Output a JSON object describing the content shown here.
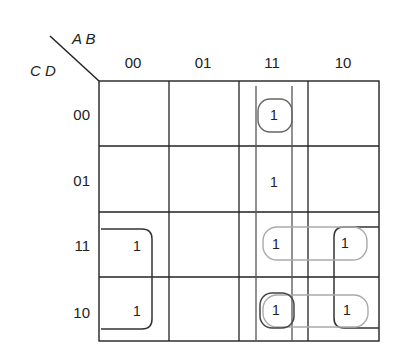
{
  "kmap": {
    "row_variables": "C D",
    "col_variables": "A B",
    "col_headers": [
      "00",
      "01",
      "11",
      "10"
    ],
    "row_headers": [
      "00",
      "01",
      "11",
      "10"
    ],
    "cells": [
      [
        "",
        "",
        "1",
        ""
      ],
      [
        "",
        "",
        "1",
        ""
      ],
      [
        "1",
        "",
        "1",
        "1"
      ],
      [
        "1",
        "",
        "1",
        "1"
      ]
    ],
    "groups": [
      {
        "name": "column-11-all-rows",
        "cells": [
          [
            0,
            2
          ],
          [
            1,
            2
          ],
          [
            2,
            2
          ],
          [
            3,
            2
          ]
        ],
        "color": "#555555"
      },
      {
        "name": "single-cell-00-11",
        "cells": [
          [
            0,
            2
          ]
        ],
        "color": "#777777"
      },
      {
        "name": "rows-11-10-col-00-wrap",
        "cells": [
          [
            2,
            0
          ],
          [
            3,
            0
          ]
        ],
        "color": "#333333"
      },
      {
        "name": "rows-11-10-col-10-wrap",
        "cells": [
          [
            2,
            3
          ],
          [
            3,
            3
          ]
        ],
        "color": "#333333"
      },
      {
        "name": "row-11-cols-11-10",
        "cells": [
          [
            2,
            2
          ],
          [
            2,
            3
          ]
        ],
        "color": "#aaaaaa"
      },
      {
        "name": "row-10-cols-11-10",
        "cells": [
          [
            3,
            2
          ],
          [
            3,
            3
          ]
        ],
        "color": "#aaaaaa"
      },
      {
        "name": "single-cell-10-11",
        "cells": [
          [
            3,
            2
          ]
        ],
        "color": "#555555"
      }
    ]
  }
}
